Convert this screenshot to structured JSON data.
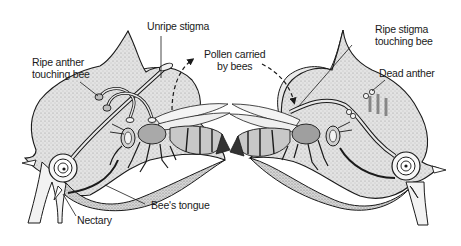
{
  "diagram": {
    "labels": {
      "ripe_anther": {
        "line1": "Ripe anther",
        "line2": "touching bee"
      },
      "unripe_stigma": "Unripe stigma",
      "pollen_carried": {
        "line1": "Pollen carried",
        "line2": "by bees"
      },
      "ripe_stigma": {
        "line1": "Ripe stigma",
        "line2": "touching bee"
      },
      "dead_anther": "Dead anther",
      "bees_tongue": "Bee's tongue",
      "nectary": "Nectary"
    },
    "nodes": [
      {
        "id": "left-flower",
        "description": "Young flower: ripe anthers, unripe stigma"
      },
      {
        "id": "right-flower",
        "description": "Older flower: dead anthers, ripe stigma"
      },
      {
        "id": "left-bee",
        "description": "Bee feeding in left flower"
      },
      {
        "id": "right-bee",
        "description": "Bee feeding in right flower"
      }
    ],
    "edges": [
      {
        "from": "left-flower",
        "to": "right-flower",
        "label": "Pollen carried by bees",
        "style": "dashed-arrow"
      }
    ],
    "colors": {
      "petal_fill": "#e6e6e6",
      "stipple_fill": "#d2d2d2",
      "outline": "#1a1a1a",
      "background": "#ffffff"
    }
  }
}
